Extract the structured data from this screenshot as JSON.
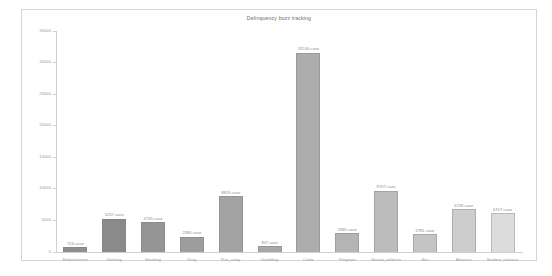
{
  "chart": {
    "title": "Delinquency buzz tracking",
    "value_suffix": "case"
  },
  "chart_data": {
    "type": "bar",
    "title": "Delinquency buzz tracking",
    "xlabel": "",
    "ylabel": "",
    "ylim": [
      0,
      35000
    ],
    "grid": false,
    "legend": "none",
    "yticks": [
      0,
      5000,
      10000,
      15000,
      20000,
      25000,
      30000,
      35000
    ],
    "ytick_labels": [
      "0",
      "5000",
      "10000",
      "15000",
      "20000",
      "25000",
      "30000",
      "35000"
    ],
    "categories": [
      "Entertainment",
      "Drinking",
      "Smoking",
      "Drug",
      "Run_away",
      "Gambling",
      "Crime",
      "Pregnant",
      "Sexual_violence",
      "Sex",
      "Absence",
      "Student_violence"
    ],
    "values": [
      726,
      5237,
      4735,
      2390,
      8813,
      907,
      31530,
      2985,
      9707,
      2781,
      6739,
      6157
    ],
    "value_labels": [
      "726 case",
      "5237 case",
      "4735 case",
      "2390 case",
      "8813 case",
      "907 case",
      "31530 case",
      "2985 case",
      "9707 case",
      "2781 case",
      "6739 case",
      "6157 case"
    ],
    "colors": [
      "#8f8f8f",
      "#8a8a8a",
      "#959595",
      "#9d9d9d",
      "#a3a3a3",
      "#a8a8a8",
      "#adadad",
      "#b4b4b4",
      "#bcbcbc",
      "#c4c4c4",
      "#cdcdcd",
      "#dcdcdc"
    ]
  }
}
